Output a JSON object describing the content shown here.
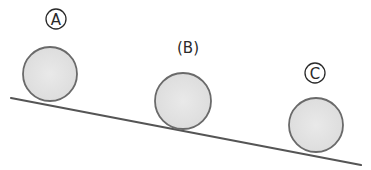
{
  "diagram": {
    "slope": {
      "x1": 11,
      "y1": 98,
      "x2": 361,
      "y2": 165,
      "color": "#555555"
    },
    "balls": [
      {
        "id": "A",
        "label": "A",
        "label_style": "circled",
        "cx": 50,
        "cy": 74,
        "r": 27,
        "label_x": 56,
        "label_y": 19
      },
      {
        "id": "B",
        "label": "(B)",
        "label_style": "parentheses",
        "cx": 183,
        "cy": 101,
        "r": 28,
        "label_x": 188,
        "label_y": 47
      },
      {
        "id": "C",
        "label": "C",
        "label_style": "circled",
        "cx": 316,
        "cy": 125,
        "r": 27,
        "label_x": 315,
        "label_y": 73
      }
    ],
    "ball_fill": "#e2e2e2",
    "ball_stroke": "#6a6a6a"
  }
}
